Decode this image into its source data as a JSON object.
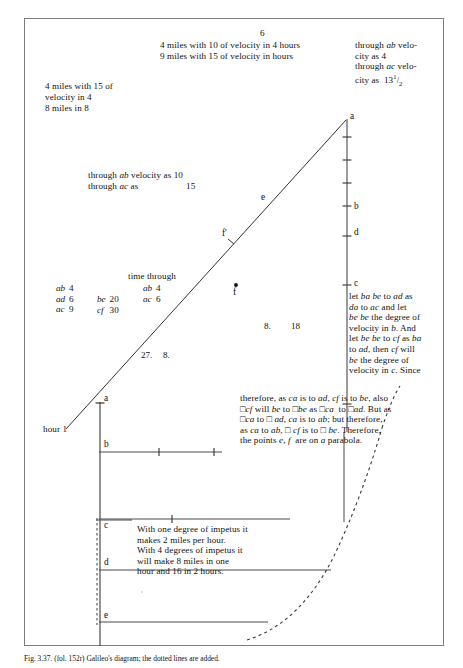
{
  "figure": {
    "domain_note": "historical manuscript diagram",
    "caption": "Fig. 3.37. (fol. 152r) Galileo's diagram; the dotted lines are added."
  },
  "colors": {
    "ink": "#111111",
    "frame": "#7c7c7c",
    "rule": "#4a4a4a",
    "dashed": "#3a3a3a"
  },
  "annotations": {
    "top_center_number": "6",
    "top_center_line1": "4 miles with 10 of velocity in 4 hours",
    "top_center_line2": "9 miles with 15 of velocity in hours",
    "top_right_l1": "through ",
    "top_right_l1_it": "ab",
    "top_right_l1_end": " velo-",
    "top_right_l2": "city as 4",
    "top_right_l3": "through ",
    "top_right_l3_it": "ac",
    "top_right_l3_end": " velo-",
    "top_right_l4_pre": "city as  13",
    "top_right_l4_frac_num": "1",
    "top_right_l4_frac_den": "2",
    "top_left_l1": "4 miles with 15 of",
    "top_left_l2": "velocity in 4",
    "top_left_l3": "8 miles in 8",
    "mid_left_l1_pre": "through ",
    "mid_left_l1_it": "ab",
    "mid_left_l1_post": " velocity as 10",
    "mid_left_l2_pre": "through ",
    "mid_left_l2_it": "ac",
    "mid_left_l2_post": " as",
    "mid_left_l2_val": "15",
    "time_through_heading": "time through",
    "numbers_27": "27.",
    "numbers_8": "8.",
    "numbers_8b": "8.",
    "numbers_18": "18",
    "hour_label": "hour 1"
  },
  "tables": {
    "left": {
      "rows": [
        {
          "k": "ab",
          "v": "4"
        },
        {
          "k": "ad",
          "v": "6"
        },
        {
          "k": "ac",
          "v": "9"
        }
      ]
    },
    "middle": {
      "rows": [
        {
          "k": "be",
          "v": "20"
        },
        {
          "k": "cf",
          "v": "30"
        }
      ]
    },
    "right": {
      "rows": [
        {
          "k": "ab",
          "v": "4"
        },
        {
          "k": "ac",
          "v": "6"
        }
      ]
    }
  },
  "proof_text": {
    "block1": [
      "let ba be to ad as",
      "da to ac and let",
      "be be the degree of",
      "velocity in b. And",
      "let be be to cf as ba",
      "to ad, then cf will",
      "be the degree of",
      "velocity in c. Since"
    ],
    "block2": [
      "therefore, as ca is to ad, cf is to be, also",
      "□cf will be to □be as □ca  to □ad. But as",
      "□ca to □ ad, ca is to ab; but therefore,",
      "as ca to ab, □ cf is to □ be. Therefore,",
      "the points e, f  are on a parabola."
    ]
  },
  "impetus_text": [
    "With one degree of impetus it",
    "makes 2 miles per hour.",
    "With 4 degrees of impetus it",
    "will make 8 miles in one",
    "hour and 16 in 2 hours."
  ],
  "point_labels": {
    "a_top": "a",
    "b_right": "b",
    "d_right": "d",
    "c_right": "c",
    "e_curve": "e",
    "f_prime": "f'",
    "f_dot": "f",
    "a_lower": "a",
    "b_lower": "b",
    "c_lower": "c",
    "d_lower": "d",
    "e_lower": "e"
  },
  "geometry": {
    "vertical_axis_top": {
      "x": 347,
      "y1": 118,
      "y2": 430
    },
    "slant_line": {
      "x1": 66,
      "y1": 428,
      "x2": 346,
      "y2": 120
    },
    "ticks_right": [
      137,
      160,
      183,
      206,
      236,
      285,
      404
    ],
    "lower_axis": {
      "x": 100,
      "y1": 404,
      "y2": 645
    },
    "horizontals": [
      {
        "y": 452,
        "x1": 100,
        "x2": 222
      },
      {
        "y": 520,
        "x1": 100,
        "x2": 290
      },
      {
        "y": 570,
        "x1": 100,
        "x2": 330
      },
      {
        "y": 622,
        "x1": 100,
        "x2": 268
      }
    ]
  }
}
